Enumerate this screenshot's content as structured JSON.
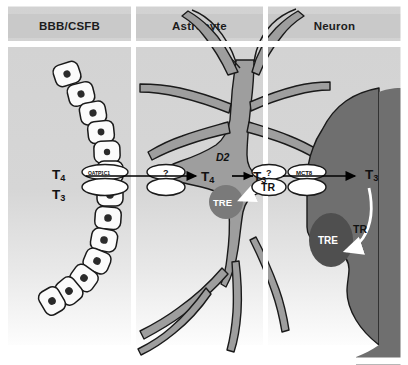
{
  "figure": {
    "panels": [
      {
        "id": "bbb",
        "label": "BBB/CSFB"
      },
      {
        "id": "astrocyte",
        "label": "Astrocyte"
      },
      {
        "id": "neuron",
        "label": "Neuron"
      }
    ]
  },
  "labels": {
    "t4_plasma": "T",
    "t4_plasma_sub": "4",
    "t3_plasma": "T",
    "t3_plasma_sub": "3",
    "t4_astro": "T",
    "t4_astro_sub": "4",
    "t3_astro": "T",
    "t3_astro_sub": "3",
    "t3_neuron": "T",
    "t3_neuron_sub": "3",
    "deiodinase": "D2",
    "tr_astrocyte": "TR",
    "tr_neuron": "TR",
    "tre_astrocyte": "TRE",
    "tre_neuron": "TRE"
  },
  "transporters": [
    {
      "id": "oatp1c1",
      "name": "OATP1C1",
      "location": "blood-brain-barrier-endothelial-cell"
    },
    {
      "id": "astro-uptake",
      "name": "?",
      "location": "astrocyte-membrane-entry"
    },
    {
      "id": "astro-efflux",
      "name": "?",
      "location": "astrocyte-membrane-exit"
    },
    {
      "id": "mct8",
      "name": "MCT8",
      "location": "neuron-membrane"
    }
  ],
  "colors": {
    "panel_background_top": "#d2d2d2",
    "panel_background_bottom": "#ffffff",
    "header_box": "#c9c9c9",
    "header_text": "#1c1c1c",
    "astrocyte_fill": "#9e9e9e",
    "astrocyte_nucleus": "#7a7a7a",
    "neuron_fill": "#6f6f6f",
    "neuron_nucleus": "#4f4f4f",
    "endothelial_cell_fill": "#fbfbfb",
    "endothelial_nucleus": "#2b2b2b",
    "outline": "#1a1a1a",
    "arrow_black": "#000000",
    "arrow_white": "#ffffff"
  },
  "flow": {
    "description": "T4 and T3 cross the BBB/CSFB via OATP1C1, enter the astrocyte through an unidentified transporter, T4 is converted to T3 by D2, T3 exits the astrocyte and enters the neuron via MCT8, where TR carries T3 to the TRE in the nucleus.",
    "steps": [
      "T4/T3 in blood",
      "OATP1C1 at barrier",
      "unknown transporter into astrocyte",
      "D2 converts T4 to T3",
      "unknown transporter out of astrocyte",
      "MCT8 into neuron",
      "TR binds TRE in nucleus"
    ]
  }
}
